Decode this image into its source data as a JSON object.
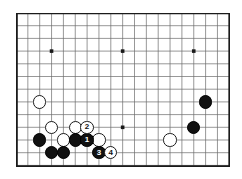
{
  "figure": {
    "kind": "go-board-diagram",
    "title": "",
    "colors": {
      "background": "#ffffff",
      "grid_line": "#6b6b6b",
      "border_line": "#1a1a1a",
      "black_stone": "#111111",
      "white_stone": "#ffffff",
      "stone_outline": "#1a1a1a",
      "black_label_text": "#ffffff",
      "white_label_text": "#111111"
    }
  },
  "board": {
    "name": "go-board",
    "columns": 18,
    "rows": 13,
    "left_px": 16,
    "top_px": 13,
    "width_px": 214,
    "height_px": 154,
    "col_spacing_px": 11.85,
    "row_spacing_px": 12.7,
    "star_points": [
      {
        "name": "star-point-left",
        "col": 3,
        "row": 3
      },
      {
        "name": "star-point-center",
        "col": 9,
        "row": 3
      },
      {
        "name": "star-point-right",
        "col": 15,
        "row": 3
      },
      {
        "name": "star-point-bottom-center",
        "col": 9,
        "row": 9
      }
    ]
  },
  "stones": [
    {
      "id": "white-stone-a",
      "color": "white",
      "col": 2,
      "row": 7,
      "label": ""
    },
    {
      "id": "white-stone-b",
      "color": "white",
      "col": 3,
      "row": 9,
      "label": ""
    },
    {
      "id": "white-stone-c",
      "color": "white",
      "col": 5,
      "row": 9,
      "label": ""
    },
    {
      "id": "white-stone-d",
      "color": "white",
      "col": 4,
      "row": 10,
      "label": ""
    },
    {
      "id": "white-stone-e",
      "color": "white",
      "col": 7,
      "row": 10,
      "label": ""
    },
    {
      "id": "white-stone-right",
      "color": "white",
      "col": 13,
      "row": 10,
      "label": ""
    },
    {
      "id": "black-stone-a",
      "color": "black",
      "col": 2,
      "row": 10,
      "label": ""
    },
    {
      "id": "black-stone-b",
      "color": "black",
      "col": 5,
      "row": 10,
      "label": ""
    },
    {
      "id": "black-stone-c",
      "color": "black",
      "col": 3,
      "row": 11,
      "label": ""
    },
    {
      "id": "black-stone-d",
      "color": "black",
      "col": 4,
      "row": 11,
      "label": ""
    },
    {
      "id": "black-stone-right-upper",
      "color": "black",
      "col": 16,
      "row": 7,
      "label": ""
    },
    {
      "id": "black-stone-right-lower",
      "color": "black",
      "col": 15,
      "row": 9,
      "label": ""
    },
    {
      "id": "move-1",
      "color": "black",
      "col": 6,
      "row": 10,
      "label": "1"
    },
    {
      "id": "move-2",
      "color": "white",
      "col": 6,
      "row": 9,
      "label": "2"
    },
    {
      "id": "move-3",
      "color": "black",
      "col": 7,
      "row": 11,
      "label": "3"
    },
    {
      "id": "move-4",
      "color": "white",
      "col": 8,
      "row": 11,
      "label": "4"
    }
  ],
  "move_sequence": {
    "label_1": "1",
    "label_2": "2",
    "label_3": "3",
    "label_4": "4"
  }
}
